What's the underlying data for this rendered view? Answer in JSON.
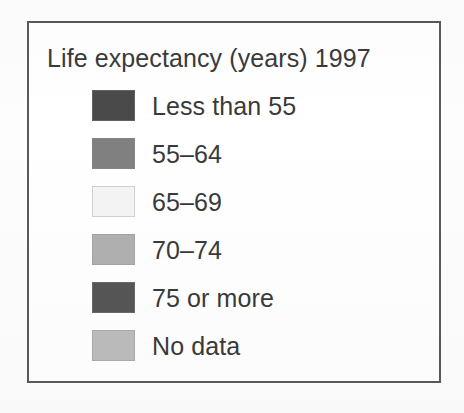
{
  "legend": {
    "title": "Life expectancy (years) 1997",
    "frame_color": "#5a5a5a",
    "background_color": "#ffffff",
    "text_color": "#3a3a3a",
    "items": [
      {
        "label": "Less than 55",
        "color": "#4a4a4a",
        "swatch_name": "swatch-less-than-55"
      },
      {
        "label": "55–64",
        "color": "#808080",
        "swatch_name": "swatch-55-64"
      },
      {
        "label": "65–69",
        "color": "#f4f4f4",
        "swatch_name": "swatch-65-69"
      },
      {
        "label": "70–74",
        "color": "#b0b0b0",
        "swatch_name": "swatch-70-74"
      },
      {
        "label": "75 or more",
        "color": "#565656",
        "swatch_name": "swatch-75-or-more"
      },
      {
        "label": "No data",
        "color": "#bcbcbc",
        "swatch_name": "swatch-no-data"
      }
    ]
  },
  "chart_data": {
    "type": "table",
    "title": "Life expectancy (years) 1997",
    "xlabel": "",
    "ylabel": "",
    "categories": [
      "Less than 55",
      "55–64",
      "65–69",
      "70–74",
      "75 or more",
      "No data"
    ],
    "values": [
      "#4a4a4a",
      "#808080",
      "#f4f4f4",
      "#b0b0b0",
      "#565656",
      "#bcbcbc"
    ],
    "legend_position": "standalone",
    "grid": false
  }
}
